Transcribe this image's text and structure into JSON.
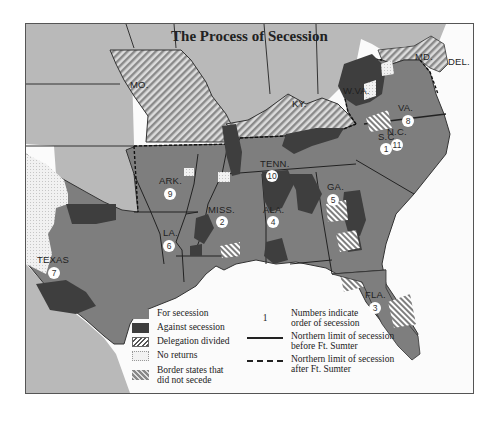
{
  "title": "The Process of Secession",
  "colors": {
    "non_confederate_states": "#b9b9b9",
    "for_secession": "#7e7e7e",
    "against_secession": "#3e3e3e",
    "water": "#fbfbfb",
    "label": "#1e1e1e"
  },
  "states": [
    {
      "abbr": "S.C.",
      "order": "1"
    },
    {
      "abbr": "MISS.",
      "order": "2"
    },
    {
      "abbr": "FLA.",
      "order": "3"
    },
    {
      "abbr": "ALA.",
      "order": "4"
    },
    {
      "abbr": "GA.",
      "order": "5"
    },
    {
      "abbr": "LA.",
      "order": "6"
    },
    {
      "abbr": "TEXAS",
      "order": "7"
    },
    {
      "abbr": "VA.",
      "order": "8"
    },
    {
      "abbr": "ARK.",
      "order": "9"
    },
    {
      "abbr": "TENN.",
      "order": "10"
    },
    {
      "abbr": "N.C.",
      "order": "11"
    }
  ],
  "border_states": [
    {
      "abbr": "MO."
    },
    {
      "abbr": "KY."
    },
    {
      "abbr": "MD."
    },
    {
      "abbr": "DEL."
    },
    {
      "abbr": "W.VA."
    }
  ],
  "legend": {
    "for": "For secession",
    "against": "Against secession",
    "divided": "Delegation divided",
    "no_returns": "No returns",
    "border_line1": "Border states that",
    "border_line2": "did not secede",
    "num_symbol": "1",
    "num_line1": "Numbers indicate",
    "num_line2": "order of secession",
    "before_line1": "Northern limit of secession",
    "before_line2": "before Ft. Sumter",
    "after_line1": "Northern limit of secession",
    "after_line2": "after Ft. Sumter"
  }
}
